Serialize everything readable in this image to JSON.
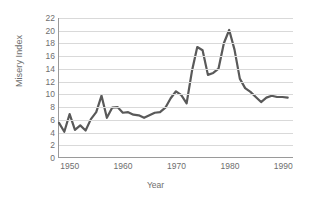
{
  "chart_data": {
    "type": "line",
    "title": "",
    "xlabel": "Year",
    "ylabel": "Misery Index",
    "xlim": [
      1948,
      1992
    ],
    "ylim": [
      0,
      22
    ],
    "ytick_step": 2,
    "yticks": [
      0,
      2,
      4,
      6,
      8,
      10,
      12,
      14,
      16,
      18,
      20,
      22
    ],
    "xticks": [
      1950,
      1960,
      1970,
      1980,
      1990
    ],
    "grid": true,
    "legend": false,
    "line_color": "#595959",
    "grid_color": "#d9d9d9",
    "axis_color": "#9a9a9a",
    "text_color": "#6e6e6e",
    "background": "#ffffff",
    "series": [
      {
        "name": "Misery Index",
        "x": [
          1948,
          1949,
          1950,
          1951,
          1952,
          1953,
          1954,
          1955,
          1956,
          1957,
          1958,
          1959,
          1960,
          1961,
          1962,
          1963,
          1964,
          1965,
          1966,
          1967,
          1968,
          1969,
          1970,
          1971,
          1972,
          1973,
          1974,
          1975,
          1976,
          1977,
          1978,
          1979,
          1980,
          1981,
          1982,
          1983,
          1984,
          1985,
          1986,
          1987,
          1988,
          1989,
          1990,
          1991
        ],
        "values": [
          5.4,
          4.0,
          6.8,
          4.3,
          5.0,
          4.2,
          6.0,
          7.1,
          9.7,
          6.2,
          7.8,
          7.9,
          7.0,
          7.1,
          6.7,
          6.6,
          6.2,
          6.6,
          7.0,
          7.1,
          7.8,
          9.3,
          10.4,
          9.8,
          8.5,
          13.6,
          17.4,
          16.9,
          13.0,
          13.3,
          14.0,
          18.0,
          20.1,
          17.0,
          12.4,
          10.9,
          10.3,
          9.5,
          8.7,
          9.4,
          9.7,
          9.5,
          9.5,
          9.4
        ],
        "color": "#595959"
      }
    ],
    "annotations": []
  },
  "axis": {
    "y_title": "Misery Index",
    "x_title": "Year"
  }
}
